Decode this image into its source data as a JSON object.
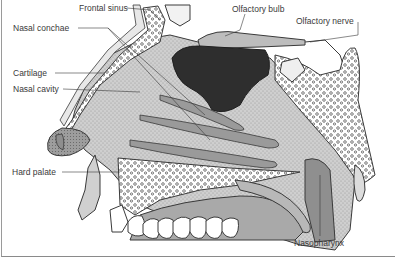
{
  "diagram": {
    "labels": [
      {
        "id": "frontal-sinus",
        "text": "Frontal sinus",
        "x": 79,
        "y": 3
      },
      {
        "id": "olfactory-bulb",
        "text": "Olfactory bulb",
        "x": 232,
        "y": 4
      },
      {
        "id": "nasal-conchae",
        "text": "Nasal conchae",
        "x": 13,
        "y": 23
      },
      {
        "id": "olfactory-nerve",
        "text": "Olfactory nerve",
        "x": 296,
        "y": 16
      },
      {
        "id": "cartilage",
        "text": "Cartilage",
        "x": 13,
        "y": 68
      },
      {
        "id": "nasal-cavity",
        "text": "Nasal cavity",
        "x": 13,
        "y": 84
      },
      {
        "id": "hard-palate",
        "text": "Hard palate",
        "x": 12,
        "y": 167
      },
      {
        "id": "nasopharynx",
        "text": "Nasopharynx",
        "x": 294,
        "y": 238
      }
    ],
    "colors": {
      "line": "#3a3a3a",
      "dark_tissue": "#2e2e2e",
      "cavity_fill": "#c9c9c9",
      "mucosa_fill": "#a9a9a9",
      "bone_fill": "#ffffff",
      "skin_fill": "#d8d8d8",
      "frame": "#9a9a9a"
    }
  }
}
